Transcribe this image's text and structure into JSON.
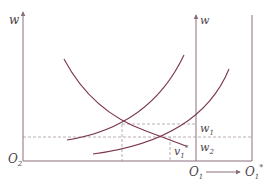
{
  "diagram": {
    "type": "economics-labor-market",
    "colors": {
      "axis": "#8a6f7a",
      "curve": "#7a3550",
      "dashed": "#a89aa0",
      "text": "#4a4347"
    },
    "left_axis": {
      "label": "w",
      "origin_label": "O",
      "origin_sub": "2"
    },
    "right_axis": {
      "label": "w",
      "origin_label": "O",
      "origin_sub": "1"
    },
    "shifted_origin": {
      "label": "O",
      "sub": "1",
      "sup": "*"
    },
    "wage_levels": [
      {
        "label": "w",
        "sub": "1"
      },
      {
        "label": "w",
        "sub": "2"
      }
    ],
    "quantity_marker": {
      "label": "v",
      "sub": "1",
      "sup": "*"
    },
    "curves": [
      {
        "name": "left-demand-curve",
        "direction": "downward"
      },
      {
        "name": "left-supply-curve",
        "direction": "upward"
      },
      {
        "name": "right-supply-curve",
        "direction": "upward"
      },
      {
        "name": "right-demand-curve",
        "direction": "downward"
      }
    ]
  }
}
